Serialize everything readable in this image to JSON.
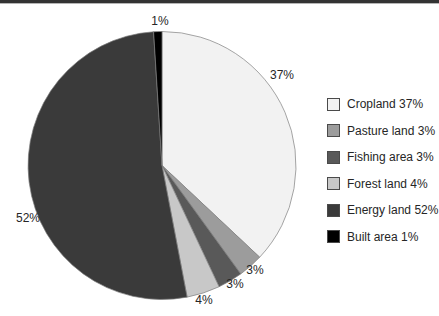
{
  "chart_data": {
    "type": "pie",
    "title": "",
    "legend_position": "right",
    "direction": "clockwise",
    "start_angle_deg": 0,
    "outline_color": "#808080",
    "slices": [
      {
        "label": "Cropland",
        "value": 37,
        "pct_label": "37%",
        "legend_label": "Cropland 37%",
        "color": "#f2f2f2"
      },
      {
        "label": "Pasture land",
        "value": 3,
        "pct_label": "3%",
        "legend_label": "Pasture land 3%",
        "color": "#9c9c9c"
      },
      {
        "label": "Fishing area",
        "value": 3,
        "pct_label": "3%",
        "legend_label": "Fishing area 3%",
        "color": "#595959"
      },
      {
        "label": "Forest land",
        "value": 4,
        "pct_label": "4%",
        "legend_label": "Forest land 4%",
        "color": "#c8c8c8"
      },
      {
        "label": "Energy land",
        "value": 52,
        "pct_label": "52%",
        "legend_label": "Energy land 52%",
        "color": "#3a3a3a"
      },
      {
        "label": "Built area",
        "value": 1,
        "pct_label": "1%",
        "legend_label": "Built area 1%",
        "color": "#000000"
      }
    ]
  }
}
